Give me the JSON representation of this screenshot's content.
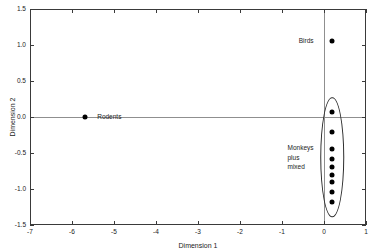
{
  "chart_data": {
    "type": "scatter",
    "title": "",
    "xlabel": "Dimension 1",
    "ylabel": "Dimension 2",
    "xlim": [
      -7,
      1
    ],
    "ylim": [
      -1.5,
      1.5
    ],
    "xticks": [
      -7,
      -6,
      -5,
      -4,
      -3,
      -2,
      -1,
      0,
      1
    ],
    "xticklabels": [
      "-7",
      "-6",
      "-5",
      "-4",
      "-3",
      "-2",
      "-1",
      "0",
      "1"
    ],
    "yticks": [
      1.5,
      1.0,
      0.5,
      0.0,
      -0.5,
      -1.0,
      -1.5
    ],
    "yticklabels": [
      "1.5",
      "1.0",
      "0.5",
      "0.0",
      "-0.5",
      "-1.0",
      "-1.5"
    ],
    "grid": false,
    "legend": "none",
    "reference_lines": [
      {
        "axis": "horizontal",
        "value": 0.0,
        "color": "#8f8f8f"
      },
      {
        "axis": "vertical",
        "value": 0.0,
        "color": "#8f8f8f"
      }
    ],
    "series": [
      {
        "name": "Rodents",
        "points": [
          {
            "x": -5.7,
            "y": 0.0
          }
        ]
      },
      {
        "name": "Birds",
        "points": [
          {
            "x": 0.2,
            "y": 1.06
          }
        ]
      },
      {
        "name": "Monkeys plus mixed",
        "points": [
          {
            "x": 0.2,
            "y": 0.07
          },
          {
            "x": 0.2,
            "y": -0.21
          },
          {
            "x": 0.2,
            "y": -0.45
          },
          {
            "x": 0.2,
            "y": -0.58
          },
          {
            "x": 0.2,
            "y": -0.7
          },
          {
            "x": 0.2,
            "y": -0.8
          },
          {
            "x": 0.2,
            "y": -0.9
          },
          {
            "x": 0.2,
            "y": -1.04
          },
          {
            "x": 0.2,
            "y": -1.18
          }
        ]
      }
    ],
    "annotations": [
      {
        "text": "Rodents",
        "x": -5.4,
        "y": 0.0,
        "align": "left"
      },
      {
        "text": "Birds",
        "x": -0.25,
        "y": 1.06,
        "align": "right"
      },
      {
        "text": "Monkeys\nplus\nmixed",
        "x": -0.25,
        "y": -0.56,
        "align": "right"
      }
    ],
    "cluster_ellipse": {
      "center_x": 0.2,
      "center_y": -0.56,
      "width_data": 0.56,
      "height_data": 1.66,
      "label": "Monkeys plus mixed"
    }
  },
  "labels": {
    "rodents": "Rodents",
    "birds": "Birds",
    "monkeys_line1": "Monkeys",
    "monkeys_line2": "plus",
    "monkeys_line3": "mixed",
    "xlabel": "Dimension 1",
    "ylabel": "Dimension 2"
  }
}
